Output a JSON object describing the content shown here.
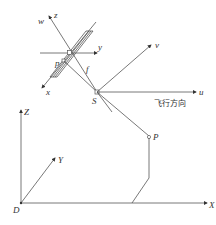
{
  "diagram": {
    "title": "",
    "colors": {
      "line": "#555555",
      "text": "#333333",
      "background": "#ffffff"
    },
    "sensor_frame": {
      "labels": {
        "w": "w",
        "z": "z",
        "y": "y",
        "x": "x",
        "p": "p",
        "f": "f"
      }
    },
    "platform_frame": {
      "labels": {
        "S": "S",
        "u": "u",
        "v": "v"
      },
      "flight_direction": "飞行方向"
    },
    "ground_point": {
      "label": "P"
    },
    "world_frame": {
      "labels": {
        "D": "D",
        "X": "X",
        "Y": "Y",
        "Z": "Z"
      }
    }
  }
}
